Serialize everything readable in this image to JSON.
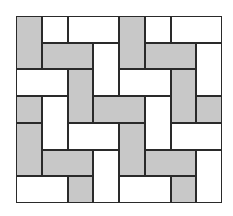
{
  "diagram": {
    "type": "tiling-pattern",
    "grid": {
      "columns": 8,
      "rows": 7
    },
    "colors": {
      "gray": "#c8c8c8",
      "white": "#ffffff",
      "border": "#2a2a2a"
    },
    "tiles": [
      {
        "col": 0,
        "row": 0,
        "w": 1,
        "h": 2,
        "fill": "gray"
      },
      {
        "col": 1,
        "row": 0,
        "w": 1,
        "h": 1,
        "fill": "white"
      },
      {
        "col": 2,
        "row": 0,
        "w": 2,
        "h": 1,
        "fill": "white"
      },
      {
        "col": 4,
        "row": 0,
        "w": 1,
        "h": 2,
        "fill": "gray"
      },
      {
        "col": 5,
        "row": 0,
        "w": 1,
        "h": 1,
        "fill": "white"
      },
      {
        "col": 6,
        "row": 0,
        "w": 2,
        "h": 1,
        "fill": "white"
      },
      {
        "col": 1,
        "row": 1,
        "w": 2,
        "h": 1,
        "fill": "gray"
      },
      {
        "col": 3,
        "row": 1,
        "w": 1,
        "h": 2,
        "fill": "white"
      },
      {
        "col": 5,
        "row": 1,
        "w": 2,
        "h": 1,
        "fill": "gray"
      },
      {
        "col": 7,
        "row": 1,
        "w": 1,
        "h": 2,
        "fill": "white"
      },
      {
        "col": 0,
        "row": 2,
        "w": 2,
        "h": 1,
        "fill": "white"
      },
      {
        "col": 2,
        "row": 2,
        "w": 1,
        "h": 2,
        "fill": "gray"
      },
      {
        "col": 4,
        "row": 2,
        "w": 2,
        "h": 1,
        "fill": "white"
      },
      {
        "col": 6,
        "row": 2,
        "w": 1,
        "h": 2,
        "fill": "gray"
      },
      {
        "col": 0,
        "row": 3,
        "w": 1,
        "h": 1,
        "fill": "gray"
      },
      {
        "col": 1,
        "row": 3,
        "w": 1,
        "h": 2,
        "fill": "white"
      },
      {
        "col": 3,
        "row": 3,
        "w": 2,
        "h": 1,
        "fill": "gray"
      },
      {
        "col": 5,
        "row": 3,
        "w": 1,
        "h": 2,
        "fill": "white"
      },
      {
        "col": 7,
        "row": 3,
        "w": 1,
        "h": 1,
        "fill": "gray"
      },
      {
        "col": 0,
        "row": 4,
        "w": 1,
        "h": 2,
        "fill": "gray"
      },
      {
        "col": 2,
        "row": 4,
        "w": 2,
        "h": 1,
        "fill": "white"
      },
      {
        "col": 4,
        "row": 4,
        "w": 1,
        "h": 2,
        "fill": "gray"
      },
      {
        "col": 6,
        "row": 4,
        "w": 2,
        "h": 1,
        "fill": "white"
      },
      {
        "col": 1,
        "row": 5,
        "w": 2,
        "h": 1,
        "fill": "gray"
      },
      {
        "col": 3,
        "row": 5,
        "w": 1,
        "h": 2,
        "fill": "white"
      },
      {
        "col": 5,
        "row": 5,
        "w": 2,
        "h": 1,
        "fill": "gray"
      },
      {
        "col": 7,
        "row": 5,
        "w": 1,
        "h": 2,
        "fill": "white"
      },
      {
        "col": 0,
        "row": 6,
        "w": 2,
        "h": 1,
        "fill": "white"
      },
      {
        "col": 2,
        "row": 6,
        "w": 1,
        "h": 1,
        "fill": "gray"
      },
      {
        "col": 4,
        "row": 6,
        "w": 2,
        "h": 1,
        "fill": "white"
      },
      {
        "col": 6,
        "row": 6,
        "w": 1,
        "h": 1,
        "fill": "gray"
      }
    ]
  }
}
